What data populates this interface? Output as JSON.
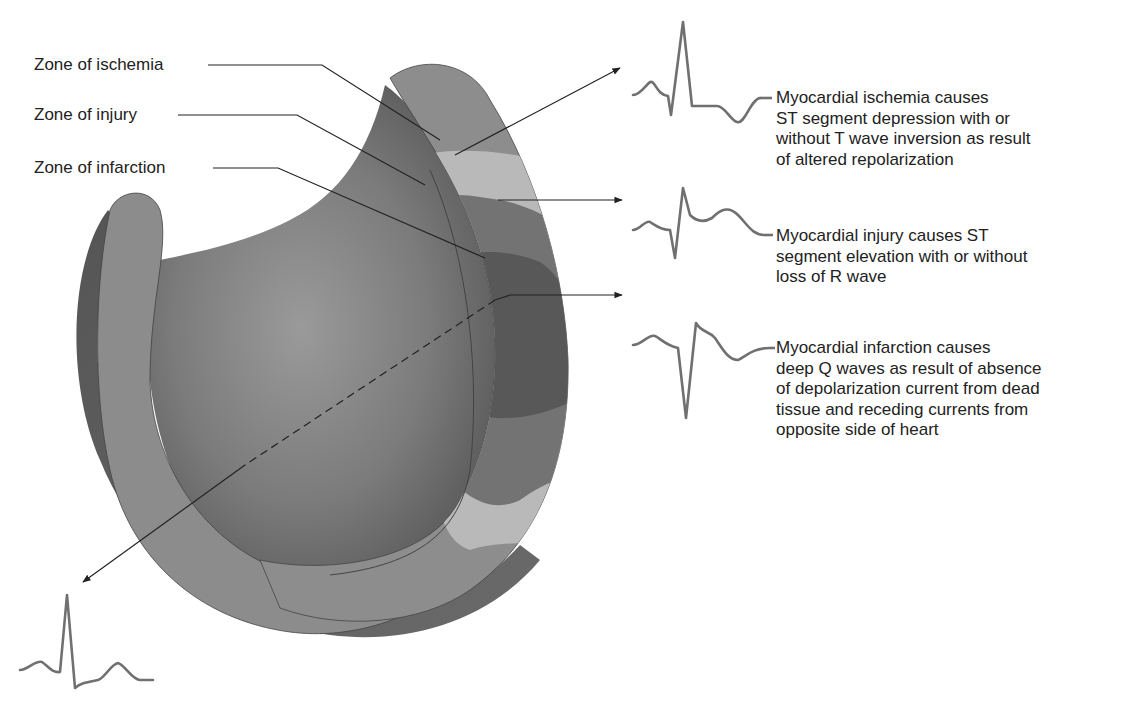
{
  "zone_labels": [
    {
      "id": "ischemia",
      "text": "Zone of ischemia"
    },
    {
      "id": "injury",
      "text": "Zone of injury"
    },
    {
      "id": "infarction",
      "text": "Zone of infarction"
    }
  ],
  "descriptions": [
    {
      "id": "ischemia",
      "lines": [
        "Myocardial ischemia causes",
        "ST segment depression with or",
        "without T wave inversion as result",
        "of altered repolarization"
      ]
    },
    {
      "id": "injury",
      "lines": [
        "Myocardial injury causes ST",
        "segment elevation with or without",
        "loss of R wave"
      ]
    },
    {
      "id": "infarction",
      "lines": [
        "Myocardial infarction causes",
        "deep Q waves as result of absence",
        "of depolarization current from dead",
        "tissue and receding currents from",
        "opposite side of heart"
      ]
    }
  ],
  "ecg_traces": [
    {
      "id": "ischemia-ecg",
      "pattern": "ST depression / T inversion"
    },
    {
      "id": "injury-ecg",
      "pattern": "ST elevation"
    },
    {
      "id": "infarction-ecg",
      "pattern": "deep Q wave"
    },
    {
      "id": "opposite-side-ecg",
      "pattern": "normal / reciprocal"
    }
  ],
  "colors": {
    "outer_wall": "#8c8c8c",
    "outer_wall_dark": "#5e5e5e",
    "inner_cavity": "#7a7a7a",
    "ischemia_zone": "#b9b9b9",
    "injury_zone": "#6e6e6e",
    "infarction_zone": "#555555",
    "ecg_stroke": "#707070",
    "line": "#222222"
  }
}
